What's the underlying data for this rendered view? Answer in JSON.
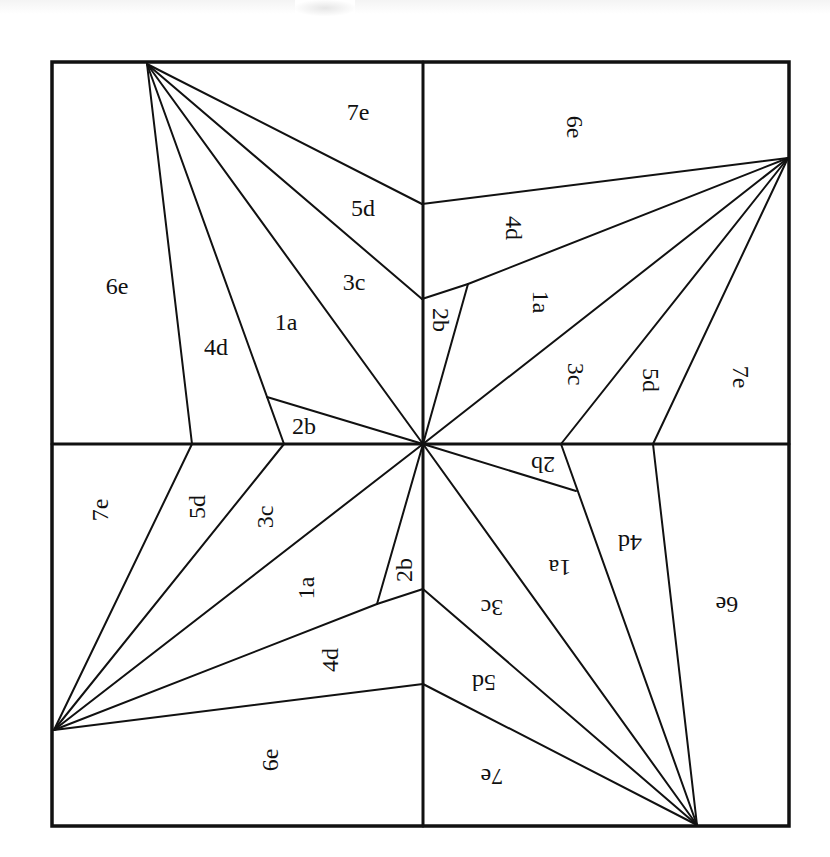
{
  "diagram": {
    "stroke_color": "#111111",
    "background": "#ffffff",
    "border": {
      "x": 52,
      "y": 62,
      "width": 737,
      "height": 764
    },
    "center": [
      423,
      444
    ],
    "midlines": {
      "vertical": {
        "x": 423,
        "y1": 62,
        "y2": 826
      },
      "horizontal": {
        "y": 444,
        "x1": 52,
        "x2": 789
      }
    },
    "quadrants": [
      {
        "id": "top-left",
        "rotation": 0,
        "apex": [
          147,
          64
        ],
        "seam_lines": [
          {
            "from": [
              147,
              64
            ],
            "to": [
              422,
              204
            ],
            "name": "7e-5d-seam"
          },
          {
            "from": [
              147,
              64
            ],
            "to": [
              422,
              299
            ],
            "name": "5d-3c-seam"
          },
          {
            "from": [
              147,
              64
            ],
            "to": [
              423,
              444
            ],
            "name": "3c-1a-seam"
          },
          {
            "from": [
              147,
              64
            ],
            "to": [
              284,
              444
            ],
            "name": "1a-4d-seam"
          },
          {
            "from": [
              147,
              64
            ],
            "to": [
              192,
              444
            ],
            "name": "4d-6e-seam"
          },
          {
            "from": [
              267,
              397
            ],
            "to": [
              423,
              444
            ],
            "name": "2b-seam"
          }
        ],
        "labels": [
          {
            "text": "7e",
            "x": 358,
            "y": 112
          },
          {
            "text": "5d",
            "x": 363,
            "y": 208
          },
          {
            "text": "3c",
            "x": 354,
            "y": 282
          },
          {
            "text": "1a",
            "x": 286,
            "y": 322
          },
          {
            "text": "4d",
            "x": 216,
            "y": 347
          },
          {
            "text": "6e",
            "x": 117,
            "y": 286
          },
          {
            "text": "2b",
            "x": 304,
            "y": 426
          }
        ]
      },
      {
        "id": "top-right",
        "rotation": 90,
        "apex": [
          788,
          158
        ],
        "seam_lines": [
          {
            "from": [
              788,
              158
            ],
            "to": [
              422,
              204
            ],
            "name": "6e-4d-seam"
          },
          {
            "from": [
              788,
              158
            ],
            "to": [
              468,
              284
            ],
            "name": "4d-1a-seam"
          },
          {
            "from": [
              468,
              284
            ],
            "to": [
              422,
              299
            ],
            "name": "4d-2b-seam"
          },
          {
            "from": [
              468,
              284
            ],
            "to": [
              423,
              444
            ],
            "name": "2b-1a-seam"
          },
          {
            "from": [
              788,
              158
            ],
            "to": [
              423,
              444
            ],
            "name": "1a-3c-seam"
          },
          {
            "from": [
              788,
              158
            ],
            "to": [
              561,
              444
            ],
            "name": "3c-5d-seam"
          },
          {
            "from": [
              788,
              158
            ],
            "to": [
              653,
              444
            ],
            "name": "5d-7e-seam"
          }
        ],
        "labels": [
          {
            "text": "6e",
            "x": 575,
            "y": 127
          },
          {
            "text": "4d",
            "x": 514,
            "y": 228
          },
          {
            "text": "1a",
            "x": 541,
            "y": 302
          },
          {
            "text": "2b",
            "x": 441,
            "y": 320
          },
          {
            "text": "3c",
            "x": 576,
            "y": 374
          },
          {
            "text": "5d",
            "x": 651,
            "y": 380
          },
          {
            "text": "7e",
            "x": 741,
            "y": 377
          }
        ]
      },
      {
        "id": "bottom-left",
        "rotation": -90,
        "apex": [
          54,
          730
        ],
        "seam_lines": [
          {
            "from": [
              54,
              730
            ],
            "to": [
              192,
              444
            ],
            "name": "7e-5d-seam"
          },
          {
            "from": [
              54,
              730
            ],
            "to": [
              284,
              444
            ],
            "name": "5d-3c-seam"
          },
          {
            "from": [
              54,
              730
            ],
            "to": [
              423,
              444
            ],
            "name": "3c-1a-seam"
          },
          {
            "from": [
              54,
              730
            ],
            "to": [
              377,
              604
            ],
            "name": "1a-4d-seam"
          },
          {
            "from": [
              377,
              604
            ],
            "to": [
              423,
              589
            ],
            "name": "4d-2b-seam"
          },
          {
            "from": [
              377,
              604
            ],
            "to": [
              423,
              444
            ],
            "name": "2b-1a-seam"
          },
          {
            "from": [
              54,
              730
            ],
            "to": [
              423,
              684
            ],
            "name": "4d-6e-seam"
          }
        ],
        "labels": [
          {
            "text": "7e",
            "x": 100,
            "y": 510
          },
          {
            "text": "5d",
            "x": 197,
            "y": 507
          },
          {
            "text": "3c",
            "x": 265,
            "y": 517
          },
          {
            "text": "1a",
            "x": 306,
            "y": 588
          },
          {
            "text": "2b",
            "x": 404,
            "y": 570
          },
          {
            "text": "4d",
            "x": 330,
            "y": 660
          },
          {
            "text": "6e",
            "x": 270,
            "y": 760
          }
        ]
      },
      {
        "id": "bottom-right",
        "rotation": 180,
        "apex": [
          697,
          825
        ],
        "seam_lines": [
          {
            "from": [
              697,
              825
            ],
            "to": [
              423,
              684
            ],
            "name": "7e-5d-seam"
          },
          {
            "from": [
              697,
              825
            ],
            "to": [
              423,
              589
            ],
            "name": "5d-3c-seam"
          },
          {
            "from": [
              697,
              825
            ],
            "to": [
              423,
              444
            ],
            "name": "3c-1a-seam"
          },
          {
            "from": [
              697,
              825
            ],
            "to": [
              561,
              444
            ],
            "name": "1a-4d-seam"
          },
          {
            "from": [
              697,
              825
            ],
            "to": [
              653,
              444
            ],
            "name": "4d-6e-seam"
          },
          {
            "from": [
              576,
              491
            ],
            "to": [
              423,
              444
            ],
            "name": "2b-seam"
          }
        ],
        "labels": [
          {
            "text": "2b",
            "x": 543,
            "y": 465
          },
          {
            "text": "4d",
            "x": 630,
            "y": 543
          },
          {
            "text": "1a",
            "x": 560,
            "y": 568
          },
          {
            "text": "3c",
            "x": 492,
            "y": 608
          },
          {
            "text": "6e",
            "x": 727,
            "y": 605
          },
          {
            "text": "5d",
            "x": 484,
            "y": 683
          },
          {
            "text": "7e",
            "x": 492,
            "y": 777
          }
        ]
      }
    ]
  }
}
